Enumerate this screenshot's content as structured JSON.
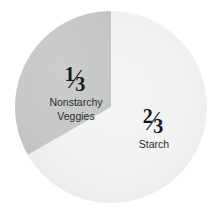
{
  "chart_data": {
    "type": "pie",
    "title": "",
    "subtitle": "",
    "xlabel": "",
    "ylabel": "",
    "legend_position": "none",
    "grid": false,
    "center": {
      "x": 111,
      "y": 107
    },
    "radius": 96,
    "slices": [
      {
        "name": "Starch",
        "fraction_label": "2/3",
        "numerator": "2",
        "denominator": "3",
        "value": 66.7,
        "color": "#f1f1f1",
        "start_angle_deg": 0,
        "end_angle_deg": 240
      },
      {
        "name": "Nonstarchy Veggies",
        "fraction_label": "1/3",
        "numerator": "1",
        "denominator": "3",
        "value": 33.3,
        "color": "#c6c7c7",
        "start_angle_deg": 240,
        "end_angle_deg": 360
      }
    ],
    "categories": [
      "Starch",
      "Nonstarchy Veggies"
    ],
    "values": [
      66.7,
      33.3
    ]
  },
  "labels": {
    "veggies": {
      "numerator": "1",
      "slash": "⁄",
      "denominator": "3",
      "line1": "Nonstarchy",
      "line2": "Veggies"
    },
    "starch": {
      "numerator": "2",
      "slash": "⁄",
      "denominator": "3",
      "line1": "Starch",
      "line2": ""
    }
  },
  "colors": {
    "background": "#ffffff",
    "slice_gray": "#c6c7c7",
    "slice_light": "#f1f1f1",
    "text": "#1c1c1c"
  }
}
